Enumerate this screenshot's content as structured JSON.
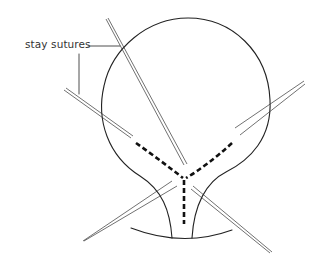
{
  "figure": {
    "type": "anatomical-line-drawing",
    "labels": [
      {
        "id": "stay-sutures",
        "text": "stay sutures",
        "x": 25,
        "y": 38
      }
    ],
    "colors": {
      "background": "#ffffff",
      "line": "#222222",
      "label": "#333333"
    }
  }
}
